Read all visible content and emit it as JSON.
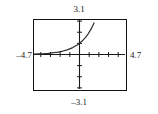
{
  "graph": {
    "labels": {
      "ymax": "3.1",
      "ymin": "–3.1",
      "xmin": "–4.7",
      "xmax": "4.7"
    },
    "colors": {
      "frame": "#111111",
      "axis": "#1a1a1a",
      "curve": "#2b2b2b",
      "background": "#ffffff"
    }
  },
  "chart_data": {
    "type": "line",
    "title": "",
    "xlabel": "",
    "ylabel": "",
    "xlim": [
      -4.7,
      4.7
    ],
    "ylim": [
      -3.1,
      3.1
    ],
    "grid": false,
    "legend": false,
    "axis_ticks": {
      "x_tick_interval": 1,
      "y_tick_interval": 1,
      "x_ticks": [
        -4,
        -3,
        -2,
        -1,
        1,
        2,
        3,
        4
      ],
      "y_ticks": [
        -3,
        -2,
        -1,
        1,
        2,
        3
      ]
    },
    "window_labels": {
      "xmin": -4.7,
      "xmax": 4.7,
      "ymin": -3.1,
      "ymax": 3.1
    },
    "series": [
      {
        "name": "exponential curve",
        "x": [
          -4.7,
          -4.2,
          -3.7,
          -3.2,
          -2.7,
          -2.2,
          -1.7,
          -1.2,
          -0.7,
          -0.2,
          0.0,
          0.3,
          0.6,
          0.9,
          1.2,
          1.5,
          1.75
        ],
        "y": [
          0.04,
          0.06,
          0.08,
          0.11,
          0.16,
          0.22,
          0.31,
          0.44,
          0.62,
          0.87,
          1.0,
          1.23,
          1.52,
          1.86,
          2.3,
          2.83,
          3.3
        ]
      }
    ]
  }
}
